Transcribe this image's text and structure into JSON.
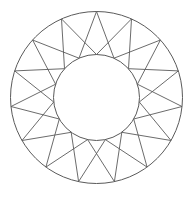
{
  "figure": {
    "type": "geometric-star-ring",
    "stroke_color": "#5a5a5a",
    "background_color": "#ffffff",
    "center": [
      96.5,
      97.5
    ],
    "outer_radius": 86,
    "inner_radius": 43,
    "point_count": 15
  },
  "outer_vertices": [
    [
      96.5,
      11.5
    ],
    [
      131.5,
      18.9
    ],
    [
      160.4,
      40.0
    ],
    [
      178.3,
      70.9
    ],
    [
      182.0,
      106.5
    ],
    [
      171.0,
      140.5
    ],
    [
      147.1,
      167.1
    ],
    [
      114.4,
      181.6
    ],
    [
      78.6,
      181.6
    ],
    [
      45.9,
      167.1
    ],
    [
      22.0,
      140.5
    ],
    [
      11.0,
      106.5
    ],
    [
      14.7,
      70.9
    ],
    [
      32.6,
      40.0
    ],
    [
      61.5,
      18.9
    ]
  ],
  "inner_vertices": [
    [
      96.5,
      54.5
    ],
    [
      114.0,
      58.2
    ],
    [
      128.5,
      68.7
    ],
    [
      137.4,
      84.2
    ],
    [
      139.3,
      102.0
    ],
    [
      133.7,
      119.0
    ],
    [
      121.8,
      132.3
    ],
    [
      105.4,
      139.6
    ],
    [
      87.6,
      139.6
    ],
    [
      71.2,
      132.3
    ],
    [
      59.3,
      119.0
    ],
    [
      53.7,
      102.0
    ],
    [
      55.6,
      84.2
    ],
    [
      64.5,
      68.7
    ],
    [
      79.0,
      58.2
    ]
  ]
}
